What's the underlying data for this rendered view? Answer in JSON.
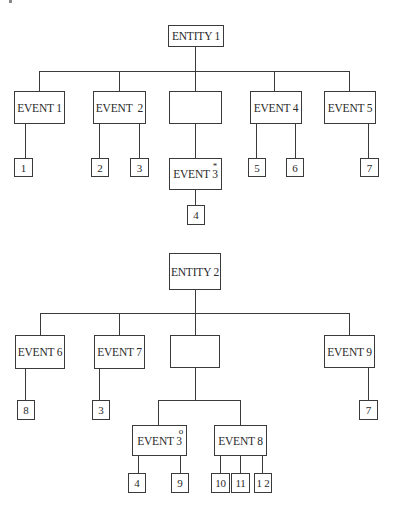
{
  "diagram_1": {
    "root": "ENTITY 1",
    "events": [
      {
        "label": "EVENT 1",
        "leaves": [
          "1"
        ]
      },
      {
        "label": "EVENT  2",
        "leaves": [
          "2",
          "3"
        ]
      },
      {
        "label": "",
        "child": {
          "label": "EVENT 3",
          "marker": "*",
          "leaves": [
            "4"
          ]
        }
      },
      {
        "label": "EVENT 4",
        "leaves": [
          "5",
          "6"
        ]
      },
      {
        "label": "EVENT 5",
        "leaves": [
          "7"
        ]
      }
    ]
  },
  "diagram_2": {
    "root": "ENTITY 2",
    "events": [
      {
        "label": "EVENT 6",
        "leaves": [
          "8"
        ]
      },
      {
        "label": "EVENT 7",
        "leaves": [
          "3"
        ]
      },
      {
        "label": "",
        "children": [
          {
            "label": "EVENT 3",
            "marker": "o",
            "leaves": [
              "4",
              "9"
            ]
          },
          {
            "label": "EVENT 8",
            "leaves": [
              "10",
              "11",
              "1 2"
            ]
          }
        ]
      },
      {
        "label": "EVENT 9",
        "leaves": [
          "7"
        ]
      }
    ]
  }
}
